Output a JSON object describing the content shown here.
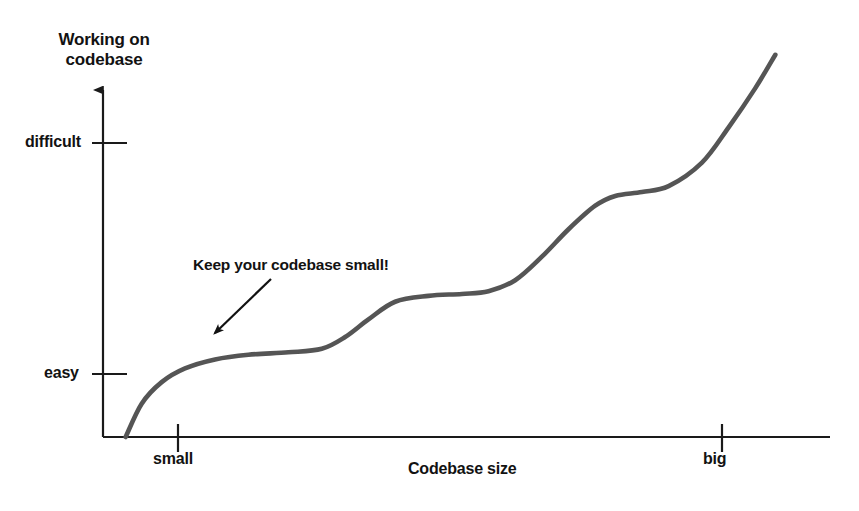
{
  "figure": {
    "background_color": "#ffffff",
    "axis_color": "#1a1a1a",
    "curve_color": "#555555",
    "text_color": "#121212",
    "width": 859,
    "height": 511
  },
  "chart_data": {
    "type": "line",
    "title": "",
    "subtitle": "",
    "xlabel": "Codebase size",
    "ylabel": "Working on codebase",
    "grid": false,
    "legend": false,
    "legend_position": "none",
    "xlim": [
      0,
      1
    ],
    "ylim": [
      0,
      1
    ],
    "x_tick_labels": [
      "small",
      "big"
    ],
    "x_tick_positions": [
      0.103,
      0.852
    ],
    "y_tick_labels": [
      "easy",
      "difficult"
    ],
    "y_tick_positions": [
      0.176,
      0.823
    ],
    "axis_arrow": "up",
    "series": [
      {
        "name": "effort vs codebase size",
        "description": "monotonic rising staircase / stepped sigmoid curve with plateaus",
        "x": [
          0.016,
          0.04,
          0.07,
          0.105,
          0.15,
          0.2,
          0.26,
          0.31,
          0.345,
          0.38,
          0.42,
          0.47,
          0.52,
          0.56,
          0.6,
          0.64,
          0.68,
          0.72,
          0.75,
          0.79,
          0.83,
          0.88,
          0.92,
          0.96,
          0.99
        ],
        "y": [
          0.0,
          0.085,
          0.14,
          0.175,
          0.198,
          0.21,
          0.216,
          0.225,
          0.255,
          0.3,
          0.345,
          0.36,
          0.365,
          0.372,
          0.4,
          0.46,
          0.53,
          0.59,
          0.615,
          0.625,
          0.64,
          0.7,
          0.79,
          0.89,
          0.975
        ]
      }
    ],
    "annotations": [
      {
        "name": "keep-codebase-small",
        "text": "Keep your codebase small!",
        "text_x": 0.125,
        "text_y": 0.555,
        "arrow_from_x": 0.23,
        "arrow_from_y": 0.463,
        "arrow_to_x": 0.148,
        "arrow_to_y": 0.3
      }
    ]
  },
  "axes": {
    "y_title": "Working on codebase",
    "x_title": "Codebase size",
    "y_ticks": [
      {
        "label": "difficult"
      },
      {
        "label": "easy"
      }
    ],
    "x_ticks": [
      {
        "label": "small"
      },
      {
        "label": "big"
      }
    ]
  },
  "annotation": {
    "text": "Keep your codebase small!"
  }
}
